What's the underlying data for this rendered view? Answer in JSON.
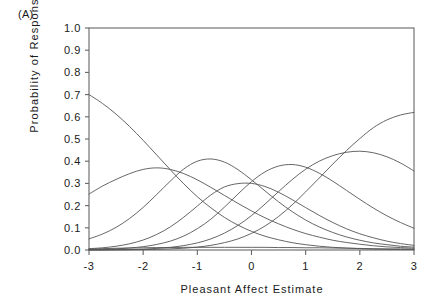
{
  "panel": {
    "label": "(A)"
  },
  "axes": {
    "xlabel": "Pleasant Affect Estimate",
    "ylabel": "Probability of Response",
    "xticks": [
      "-3",
      "-2",
      "-1",
      "0",
      "1",
      "2",
      "3"
    ],
    "yticks": [
      "0.0",
      "0.1",
      "0.2",
      "0.3",
      "0.4",
      "0.5",
      "0.6",
      "0.7",
      "0.8",
      "0.9",
      "1.0"
    ]
  },
  "style": {
    "line_color": "#555555",
    "axis_color": "#666666",
    "background": "#ffffff",
    "text_color": "#1a1a1a"
  },
  "chart_data": {
    "type": "line",
    "title": "(A)",
    "xlabel": "Pleasant Affect Estimate",
    "ylabel": "Probability of Response",
    "xlim": [
      -3,
      3
    ],
    "ylim": [
      0.0,
      1.0
    ],
    "xticks": [
      -3,
      -2,
      -1,
      0,
      1,
      2,
      3
    ],
    "yticks": [
      0.0,
      0.1,
      0.2,
      0.3,
      0.4,
      0.5,
      0.6,
      0.7,
      0.8,
      0.9,
      1.0
    ],
    "grid": false,
    "legend": "none",
    "x": [
      -3.0,
      -2.75,
      -2.5,
      -2.25,
      -2.0,
      -1.75,
      -1.5,
      -1.25,
      -1.0,
      -0.75,
      -0.5,
      -0.25,
      0.0,
      0.25,
      0.5,
      0.75,
      1.0,
      1.25,
      1.5,
      1.75,
      2.0,
      2.25,
      2.5,
      2.75,
      3.0
    ],
    "series": [
      {
        "name": "category-1-decreasing",
        "peak_x": -3.0,
        "peak_y": 0.7,
        "values": [
          0.7,
          0.66,
          0.612,
          0.556,
          0.494,
          0.428,
          0.362,
          0.298,
          0.24,
          0.19,
          0.147,
          0.112,
          0.084,
          0.062,
          0.046,
          0.033,
          0.024,
          0.017,
          0.012,
          0.009,
          0.006,
          0.004,
          0.003,
          0.002,
          0.002
        ]
      },
      {
        "name": "category-2-peak-neg1.9",
        "peak_x": -1.9,
        "peak_y": 0.37,
        "values": [
          0.252,
          0.288,
          0.318,
          0.344,
          0.363,
          0.37,
          0.363,
          0.344,
          0.316,
          0.282,
          0.246,
          0.21,
          0.176,
          0.145,
          0.118,
          0.094,
          0.074,
          0.058,
          0.044,
          0.034,
          0.026,
          0.019,
          0.014,
          0.011,
          0.008
        ]
      },
      {
        "name": "category-3-peak-neg0.85",
        "peak_x": -0.85,
        "peak_y": 0.41,
        "values": [
          0.05,
          0.072,
          0.102,
          0.142,
          0.192,
          0.25,
          0.31,
          0.365,
          0.4,
          0.41,
          0.396,
          0.362,
          0.316,
          0.266,
          0.217,
          0.173,
          0.135,
          0.104,
          0.079,
          0.059,
          0.044,
          0.032,
          0.024,
          0.017,
          0.013
        ]
      },
      {
        "name": "category-4-peak-0.05",
        "peak_x": -0.05,
        "peak_y": 0.3,
        "values": [
          0.006,
          0.01,
          0.017,
          0.028,
          0.045,
          0.07,
          0.104,
          0.148,
          0.198,
          0.248,
          0.284,
          0.299,
          0.3,
          0.286,
          0.26,
          0.227,
          0.191,
          0.156,
          0.124,
          0.096,
          0.073,
          0.055,
          0.04,
          0.029,
          0.021
        ]
      },
      {
        "name": "category-5-peak-0.8",
        "peak_x": 0.8,
        "peak_y": 0.385,
        "values": [
          0.002,
          0.003,
          0.005,
          0.009,
          0.015,
          0.025,
          0.04,
          0.063,
          0.096,
          0.139,
          0.193,
          0.252,
          0.308,
          0.352,
          0.378,
          0.385,
          0.373,
          0.346,
          0.31,
          0.269,
          0.228,
          0.189,
          0.154,
          0.124,
          0.098
        ]
      },
      {
        "name": "category-6-peak-1.9",
        "peak_x": 1.9,
        "peak_y": 0.445,
        "values": [
          0.0,
          0.001,
          0.001,
          0.002,
          0.004,
          0.007,
          0.012,
          0.02,
          0.032,
          0.05,
          0.076,
          0.111,
          0.155,
          0.207,
          0.263,
          0.317,
          0.364,
          0.4,
          0.425,
          0.44,
          0.445,
          0.438,
          0.42,
          0.392,
          0.356
        ]
      },
      {
        "name": "category-7-increasing",
        "peak_x": 3.0,
        "peak_y": 0.62,
        "values": [
          0.0,
          0.0,
          0.001,
          0.001,
          0.002,
          0.003,
          0.005,
          0.008,
          0.013,
          0.021,
          0.033,
          0.05,
          0.075,
          0.108,
          0.151,
          0.203,
          0.262,
          0.324,
          0.387,
          0.447,
          0.502,
          0.551,
          0.586,
          0.608,
          0.62
        ]
      },
      {
        "name": "category-8-near-zero",
        "peak_x": 0.0,
        "peak_y": 0.012,
        "values": [
          0.004,
          0.006,
          0.008,
          0.009,
          0.01,
          0.011,
          0.011,
          0.012,
          0.012,
          0.012,
          0.012,
          0.012,
          0.012,
          0.012,
          0.011,
          0.011,
          0.01,
          0.01,
          0.009,
          0.008,
          0.007,
          0.006,
          0.005,
          0.005,
          0.004
        ]
      }
    ]
  }
}
